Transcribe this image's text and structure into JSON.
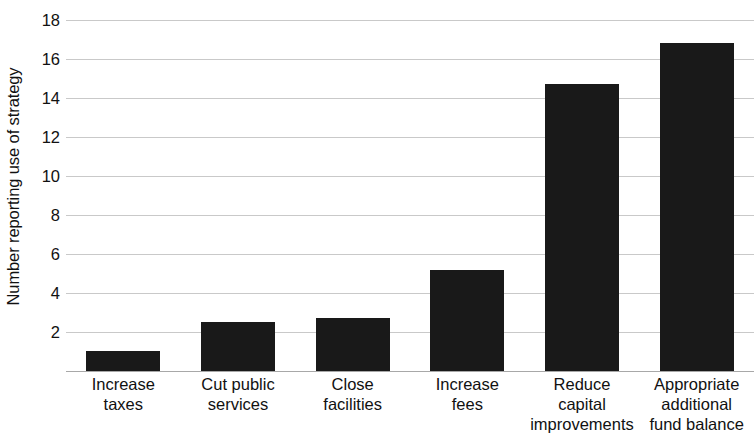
{
  "chart_data": {
    "type": "bar",
    "title": "",
    "xlabel": "",
    "ylabel": "Number reporting use of strategy",
    "categories": [
      "Increase taxes",
      "Cut public services",
      "Close facilities",
      "Increase fees",
      "Reduce capital improvements",
      "Appropriate additional fund balance"
    ],
    "category_lines": [
      [
        "Increase",
        "taxes"
      ],
      [
        "Cut public",
        "services"
      ],
      [
        "Close",
        "facilities"
      ],
      [
        "Increase",
        "fees"
      ],
      [
        "Reduce",
        "capital",
        "improvements"
      ],
      [
        "Appropriate",
        "additional",
        "fund balance"
      ]
    ],
    "values": [
      1.0,
      2.5,
      2.7,
      5.2,
      14.7,
      16.8
    ],
    "ylim": [
      0,
      18
    ],
    "yticks": [
      2,
      4,
      6,
      8,
      10,
      12,
      14,
      16,
      18
    ],
    "ytick_labels": [
      "2",
      "4",
      "6",
      "8",
      "10",
      "12",
      "14",
      "16",
      "18"
    ],
    "grid": true,
    "legend": false,
    "bar_color": "#191919",
    "gridline_color": "#c9c9c9",
    "background_color": "#ffffff"
  }
}
